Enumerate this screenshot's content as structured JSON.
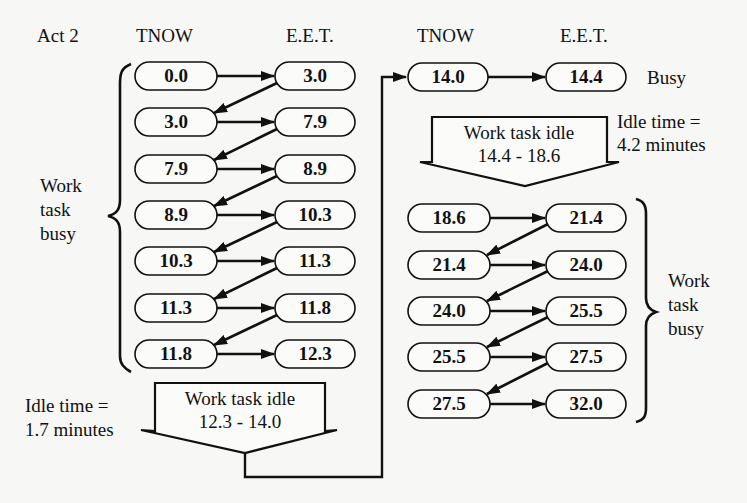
{
  "headers": {
    "activity_label": "Act 2",
    "left_tnow": "TNOW",
    "left_eet": "E.E.T.",
    "right_tnow": "TNOW",
    "right_eet": "E.E.T."
  },
  "left_block": {
    "rows": [
      {
        "tnow": "0.0",
        "eet": "3.0"
      },
      {
        "tnow": "3.0",
        "eet": "7.9"
      },
      {
        "tnow": "7.9",
        "eet": "8.9"
      },
      {
        "tnow": "8.9",
        "eet": "10.3"
      },
      {
        "tnow": "10.3",
        "eet": "11.3"
      },
      {
        "tnow": "11.3",
        "eet": "11.8"
      },
      {
        "tnow": "11.8",
        "eet": "12.3"
      }
    ],
    "brace_label": [
      "Work",
      "task",
      "busy"
    ],
    "idle_box": {
      "title": "Work task idle",
      "range": "12.3 - 14.0"
    },
    "idle_note": [
      "Idle time =",
      "1.7 minutes"
    ]
  },
  "right_block": {
    "top_row": {
      "tnow": "14.0",
      "eet": "14.4",
      "status": "Busy"
    },
    "idle_box": {
      "title": "Work task idle",
      "range": "14.4 - 18.6"
    },
    "idle_note": [
      "Idle time =",
      "4.2 minutes"
    ],
    "rows": [
      {
        "tnow": "18.6",
        "eet": "21.4"
      },
      {
        "tnow": "21.4",
        "eet": "24.0"
      },
      {
        "tnow": "24.0",
        "eet": "25.5"
      },
      {
        "tnow": "25.5",
        "eet": "27.5"
      },
      {
        "tnow": "27.5",
        "eet": "32.0"
      }
    ],
    "brace_label": [
      "Work",
      "task",
      "busy"
    ]
  }
}
